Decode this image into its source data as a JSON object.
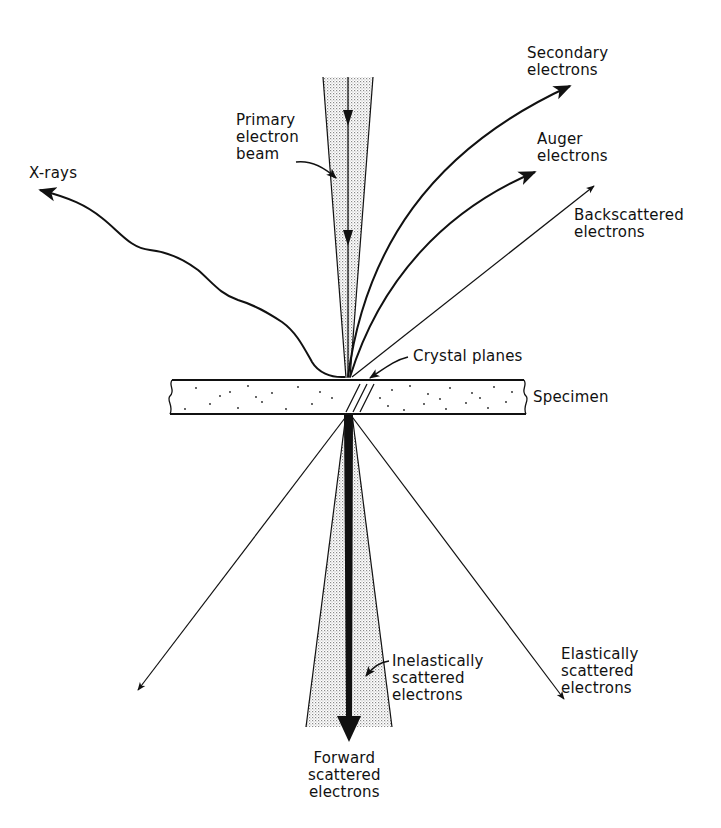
{
  "diagram": {
    "type": "electron-specimen-interaction",
    "colors": {
      "ink": "#111111",
      "stipple": "#bdbdbd",
      "background": "#ffffff"
    },
    "labels": {
      "primary_beam": "Primary\nelectron\nbeam",
      "xrays": "X-rays",
      "secondary": "Secondary\nelectrons",
      "auger": "Auger\nelectrons",
      "backscattered": "Backscattered\nelectrons",
      "crystal_planes": "Crystal planes",
      "specimen": "Specimen",
      "inelastic": "Inelastically\nscattered\nelectrons",
      "elastic": "Elastically\nscattered\nelectrons",
      "forward": "Forward\nscattered\nelectrons"
    }
  }
}
